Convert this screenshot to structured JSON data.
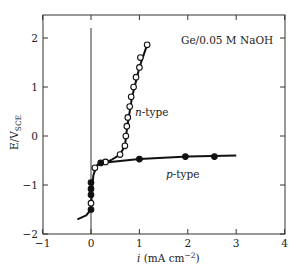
{
  "chart_data": {
    "type": "scatter",
    "title": "",
    "annotation": "Ge/0.05 M NaOH",
    "xlabel": "i (mA cm⁻²)",
    "xlabel_italic_part": "i",
    "xlabel_rest": " (mA cm",
    "xlabel_sup": "−2",
    "xlabel_close": ")",
    "ylabel": "E/V_SCE",
    "ylabel_main": "E/V",
    "ylabel_sub": "SCE",
    "xlim": [
      -1,
      4
    ],
    "ylim": [
      -2,
      2.5
    ],
    "xticks": [
      -1,
      0,
      1,
      2,
      3,
      4
    ],
    "xtick_labels": [
      "−1",
      "0",
      "1",
      "2",
      "3",
      "4"
    ],
    "yticks": [
      -2,
      -1,
      0,
      1,
      2
    ],
    "ytick_labels": [
      "−2",
      "−1",
      "0",
      "1",
      "2"
    ],
    "grid": false,
    "vertical_reference_line_x": 0,
    "series": [
      {
        "name": "n-type",
        "label_italic": "n",
        "label_rest": "-type",
        "marker": "open-circle",
        "x": [
          0.0,
          0.08,
          0.3,
          0.6,
          0.7,
          0.72,
          0.74,
          0.76,
          0.8,
          0.83,
          0.88,
          0.93,
          1.0,
          1.02,
          1.16
        ],
        "y": [
          -1.37,
          -0.65,
          -0.53,
          -0.38,
          -0.2,
          0.0,
          0.2,
          0.38,
          0.6,
          0.8,
          1.0,
          1.2,
          1.4,
          1.6,
          1.86
        ]
      },
      {
        "name": "p-type",
        "label_italic": "p",
        "label_rest": "-type",
        "marker": "filled-circle",
        "x": [
          0.0,
          0.0,
          0.0,
          0.0,
          0.2,
          1.0,
          1.95,
          2.55
        ],
        "y": [
          -1.5,
          -1.2,
          -1.08,
          -0.95,
          -0.55,
          -0.47,
          -0.42,
          -0.42
        ]
      }
    ],
    "curves": {
      "common_lower": {
        "x": [
          -0.28,
          -0.1,
          0.0,
          0.02,
          0.05,
          0.12,
          0.2
        ],
        "y": [
          -1.7,
          -1.62,
          -1.5,
          -1.1,
          -0.8,
          -0.6,
          -0.55
        ]
      },
      "n_type_fit": {
        "x": [
          0.2,
          0.4,
          0.6,
          0.7,
          0.75,
          0.85,
          1.0,
          1.16
        ],
        "y": [
          -0.55,
          -0.5,
          -0.38,
          -0.2,
          0.2,
          0.8,
          1.4,
          1.86
        ]
      },
      "p_type_fit": {
        "x": [
          0.2,
          1.0,
          2.0,
          3.0
        ],
        "y": [
          -0.55,
          -0.47,
          -0.42,
          -0.4
        ]
      }
    },
    "legend_position": "inline labels"
  }
}
